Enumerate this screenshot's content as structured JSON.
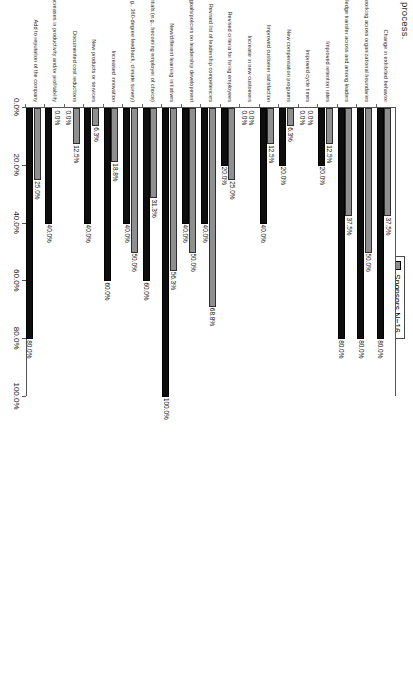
{
  "caption_fragment": "process.",
  "legend": {
    "position": "top-center",
    "items": [
      {
        "label": "Sponsors N=16",
        "color": "#8f8f8f",
        "name": "sponsors"
      },
      {
        "label": "Partners N=5",
        "color": "#0d0d0d",
        "name": "partners"
      }
    ]
  },
  "chart_data": {
    "type": "bar",
    "title": "",
    "xlabel": "",
    "ylabel": "",
    "ylim": [
      0,
      100
    ],
    "grid": false,
    "legend_position": "top-center",
    "tick_labels": [
      "0.0%",
      "20.0%",
      "40.0%",
      "60.0%",
      "80.0%",
      "100.0%"
    ],
    "tick_values": [
      0,
      20,
      40,
      60,
      80,
      100
    ],
    "categories": [
      "Change in exhibited behavior",
      "Improved collaboration/networking across organizational boundaries",
      "Improved knowledge transfer across and among leaders",
      "Improved retention rates",
      "Improved cycle times",
      "New compensation programs",
      "Improved customer satisfaction",
      "Increase in new customers",
      "Revised criteria for hiring employees",
      "Revised list of leadership competencies",
      "Revised goals/policies on leadership development",
      "New/different learning initiatives",
      "Improved ability to attract high potentials (e.g., becoming employer of choice)",
      "Improved employee feedback about managers (e.g., 360-degree feedback, climate survey)",
      "Increased innovation",
      "New products or services",
      "Documented cost reductions",
      "Measurable increases in productivity and/or profitability",
      "Add to reputation of the company"
    ],
    "series": [
      {
        "name": "Sponsors N=16",
        "color": "#8f8f8f",
        "values": [
          37.5,
          50.0,
          37.5,
          12.5,
          0.0,
          6.3,
          12.5,
          0.0,
          25.0,
          68.8,
          50.0,
          56.3,
          31.3,
          50.0,
          18.8,
          6.3,
          12.5,
          0.0,
          25.0
        ],
        "labels": [
          "37.5%",
          "50.0%",
          "37.5%",
          "12.5%",
          "0.0%",
          "6.3%",
          "12.5%",
          "0.0%",
          "25.0%",
          "68.8%",
          "50.0%",
          "56.3%",
          "31.3%",
          "50.0%",
          "18.8%",
          "6.3%",
          "12.5%",
          "0.0%",
          "25.0%"
        ]
      },
      {
        "name": "Partners N=5",
        "color": "#0d0d0d",
        "values": [
          80.0,
          80.0,
          80.0,
          20.0,
          0.0,
          20.0,
          40.0,
          0.0,
          20.0,
          40.0,
          40.0,
          100.0,
          60.0,
          40.0,
          60.0,
          40.0,
          0.0,
          40.0,
          80.0
        ],
        "labels": [
          "80.0%",
          "80.0%",
          "80.0%",
          "20.0%",
          "0.0%",
          "20.0%",
          "40.0%",
          "0.0%",
          "20.0%",
          "40.0%",
          "40.0%",
          "100.0%",
          "60.0%",
          "40.0%",
          "60.0%",
          "40.0%",
          "0.0%",
          "40.0%",
          "80.0%"
        ]
      }
    ]
  }
}
